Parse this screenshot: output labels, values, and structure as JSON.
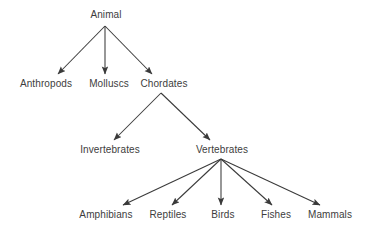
{
  "diagram": {
    "type": "hierarchy-tree",
    "background_color": "#ffffff",
    "text_color": "#3d3d3d",
    "edge_color": "#3a3a3a",
    "nodes": [
      {
        "id": "animal",
        "label": "Animal",
        "level": 0,
        "cx": 106,
        "cy": 15
      },
      {
        "id": "anthropods",
        "label": "Anthropods",
        "level": 1,
        "cx": 46,
        "cy": 84
      },
      {
        "id": "molluscs",
        "label": "Molluscs",
        "level": 1,
        "cx": 109,
        "cy": 84
      },
      {
        "id": "chordates",
        "label": "Chordates",
        "level": 1,
        "cx": 164,
        "cy": 84
      },
      {
        "id": "invertebrates",
        "label": "Invertebrates",
        "level": 2,
        "cx": 110,
        "cy": 150
      },
      {
        "id": "vertebrates",
        "label": "Vertebrates",
        "level": 2,
        "cx": 222,
        "cy": 150
      },
      {
        "id": "amphibians",
        "label": "Amphibians",
        "level": 3,
        "cx": 106,
        "cy": 215
      },
      {
        "id": "reptiles",
        "label": "Reptiles",
        "level": 3,
        "cx": 168,
        "cy": 215
      },
      {
        "id": "birds",
        "label": "Birds",
        "level": 3,
        "cx": 223,
        "cy": 215
      },
      {
        "id": "fishes",
        "label": "Fishes",
        "level": 3,
        "cx": 276,
        "cy": 215
      },
      {
        "id": "mammals",
        "label": "Mammals",
        "level": 3,
        "cx": 330,
        "cy": 215
      }
    ],
    "edges": [
      {
        "from": "animal",
        "to": "anthropods",
        "x1": 105,
        "y1": 26,
        "x2": 58,
        "y2": 74
      },
      {
        "from": "animal",
        "to": "molluscs",
        "x1": 105,
        "y1": 26,
        "x2": 105,
        "y2": 74
      },
      {
        "from": "animal",
        "to": "chordates",
        "x1": 105,
        "y1": 26,
        "x2": 152,
        "y2": 74
      },
      {
        "from": "chordates",
        "to": "invertebrates",
        "x1": 161,
        "y1": 93,
        "x2": 114,
        "y2": 140
      },
      {
        "from": "chordates",
        "to": "vertebrates",
        "x1": 161,
        "y1": 93,
        "x2": 210,
        "y2": 140
      },
      {
        "from": "vertebrates",
        "to": "amphibians",
        "x1": 221,
        "y1": 159,
        "x2": 123,
        "y2": 205
      },
      {
        "from": "vertebrates",
        "to": "reptiles",
        "x1": 221,
        "y1": 159,
        "x2": 172,
        "y2": 205
      },
      {
        "from": "vertebrates",
        "to": "birds",
        "x1": 221,
        "y1": 159,
        "x2": 221,
        "y2": 205
      },
      {
        "from": "vertebrates",
        "to": "fishes",
        "x1": 221,
        "y1": 159,
        "x2": 272,
        "y2": 205
      },
      {
        "from": "vertebrates",
        "to": "mammals",
        "x1": 221,
        "y1": 159,
        "x2": 320,
        "y2": 205
      }
    ]
  }
}
